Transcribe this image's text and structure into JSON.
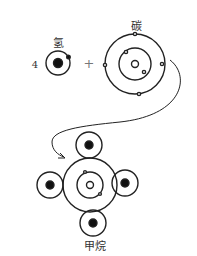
{
  "labels": {
    "hydrogen": "氢",
    "hydrogen_count": "4",
    "plus": "+",
    "carbon": "碳",
    "methane": "甲烷"
  },
  "colors": {
    "stroke": "#222222",
    "nucleus_fill": "#111111",
    "background": "#ffffff"
  }
}
